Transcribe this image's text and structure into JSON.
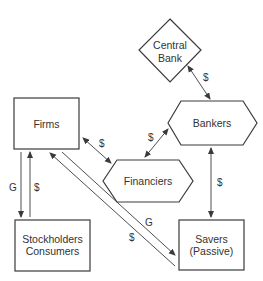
{
  "diagram": {
    "nodes": {
      "firms": {
        "label": "Firms",
        "shape": "rectangle"
      },
      "stockholders": {
        "line1": "Stockholders",
        "line2": "Consumers",
        "shape": "rectangle"
      },
      "savers": {
        "line1": "Savers",
        "line2": "(Passive)",
        "shape": "rectangle"
      },
      "central_bank": {
        "line1": "Central",
        "line2": "Bank",
        "shape": "diamond"
      },
      "bankers": {
        "label": "Bankers",
        "shape": "hexagon"
      },
      "financiers": {
        "label": "Financiers",
        "shape": "hexagon"
      }
    },
    "edges": [
      {
        "from": "central_bank",
        "to": "bankers",
        "label": "$",
        "direction": "both"
      },
      {
        "from": "bankers",
        "to": "financiers",
        "label": "$",
        "direction": "both"
      },
      {
        "from": "firms",
        "to": "financiers",
        "label": "$",
        "direction": "both"
      },
      {
        "from": "bankers",
        "to": "savers",
        "label": "$",
        "direction": "both"
      },
      {
        "from": "firms",
        "to": "stockholders",
        "label": "G",
        "direction": "forward"
      },
      {
        "from": "stockholders",
        "to": "firms",
        "label": "$",
        "direction": "forward"
      },
      {
        "from": "firms",
        "to": "savers",
        "label": "G",
        "direction": "forward"
      },
      {
        "from": "savers",
        "to": "firms",
        "label": "$",
        "direction": "forward"
      }
    ],
    "edge_labels": {
      "cb_bankers": "$",
      "bankers_financiers": "$",
      "firms_financiers": "$",
      "bankers_savers": "$",
      "firms_stock_g": "G",
      "stock_firms_dollar": "$",
      "firms_savers_g": "G",
      "savers_firms_dollar": "$"
    }
  }
}
